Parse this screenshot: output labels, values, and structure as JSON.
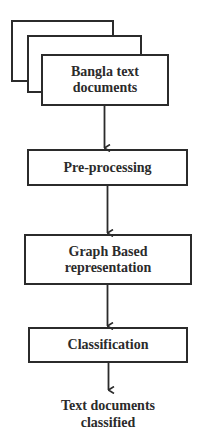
{
  "diagram": {
    "type": "flowchart",
    "direction": "top-to-bottom",
    "nodes": [
      {
        "id": "input",
        "shape": "stacked-documents",
        "lines": [
          "Bangla text",
          "documents"
        ]
      },
      {
        "id": "preprocessing",
        "shape": "rectangle",
        "lines": [
          "Pre-processing"
        ]
      },
      {
        "id": "graph",
        "shape": "rectangle",
        "lines": [
          "Graph Based",
          "representation"
        ]
      },
      {
        "id": "classification",
        "shape": "rectangle",
        "lines": [
          "Classification"
        ]
      },
      {
        "id": "output",
        "shape": "text",
        "lines": [
          "Text documents",
          "classified"
        ]
      }
    ],
    "edges": [
      {
        "from": "input",
        "to": "preprocessing"
      },
      {
        "from": "preprocessing",
        "to": "graph"
      },
      {
        "from": "graph",
        "to": "classification"
      },
      {
        "from": "classification",
        "to": "output"
      }
    ],
    "colors": {
      "stroke": "#2b2b2b",
      "background": "#ffffff",
      "text": "#2b2b2b"
    }
  }
}
